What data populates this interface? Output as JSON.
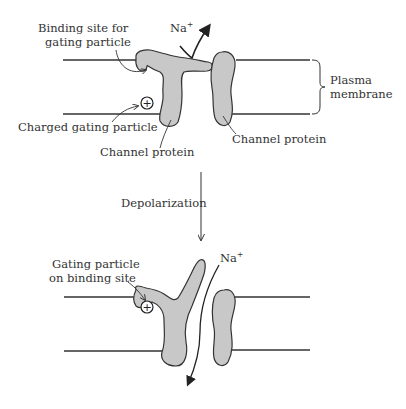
{
  "top_panel": {
    "ion_label": "Na",
    "ion_charge": "+",
    "binding_site_label_line1": "Binding site for",
    "binding_site_label_line2": "gating particle",
    "charged_particle_label": "Charged gating particle",
    "channel_protein_left_label": "Channel protein",
    "channel_protein_right_label": "Channel protein",
    "membrane_label_line1": "Plasma",
    "membrane_label_line2": "membrane",
    "particle_symbol": "+"
  },
  "transition": {
    "label": "Depolarization"
  },
  "bottom_panel": {
    "ion_label": "Na",
    "ion_charge": "+",
    "gating_label_line1": "Gating particle",
    "gating_label_line2": "on binding site",
    "particle_symbol": "+"
  },
  "colors": {
    "protein_fill": "#c8c8c8",
    "line": "#333333",
    "background": "#ffffff"
  }
}
